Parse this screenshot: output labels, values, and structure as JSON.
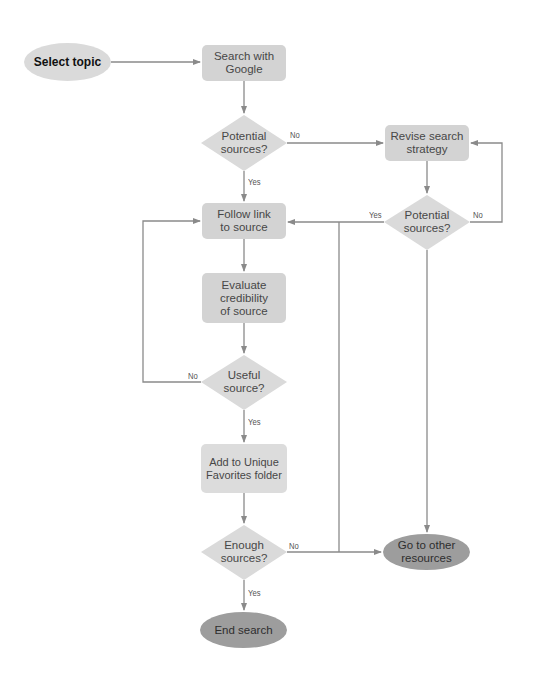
{
  "colors": {
    "box_fill": "#d3d3d3",
    "box_fill_light": "#dcdcdc",
    "diamond_fill": "#dadada",
    "terminal_dark": "#9d9d9d",
    "start_fill": "#dadada",
    "line": "#8a8a8a"
  },
  "nodes": {
    "select_topic": {
      "label": "Select topic",
      "shape": "ellipse"
    },
    "search_google": {
      "label": "Search with Google",
      "shape": "box"
    },
    "potential_sources_1": {
      "label": "Potential sources?",
      "shape": "diamond"
    },
    "revise_strategy": {
      "label": "Revise search strategy",
      "shape": "box"
    },
    "potential_sources_2": {
      "label": "Potential sources?",
      "shape": "diamond"
    },
    "follow_link": {
      "label": "Follow link to source",
      "shape": "box"
    },
    "evaluate": {
      "label": "Evaluate credibility of source",
      "shape": "box"
    },
    "useful_source": {
      "label": "Useful source?",
      "shape": "diamond"
    },
    "add_favorites": {
      "label": "Add to Unique Favorites folder",
      "shape": "box"
    },
    "enough_sources": {
      "label": "Enough sources?",
      "shape": "diamond"
    },
    "end_search": {
      "label": "End search",
      "shape": "ellipse"
    },
    "other_resources": {
      "label": "Go to other resources",
      "shape": "ellipse"
    }
  },
  "edge_labels": {
    "ps1_no": "No",
    "ps1_yes": "Yes",
    "ps2_yes": "Yes",
    "ps2_no": "No",
    "useful_no": "No",
    "useful_yes": "Yes",
    "enough_no": "No",
    "enough_yes": "Yes"
  },
  "edges": [
    {
      "from": "select_topic",
      "to": "search_google"
    },
    {
      "from": "search_google",
      "to": "potential_sources_1"
    },
    {
      "from": "potential_sources_1",
      "to": "revise_strategy",
      "label": "No"
    },
    {
      "from": "potential_sources_1",
      "to": "follow_link",
      "label": "Yes"
    },
    {
      "from": "revise_strategy",
      "to": "potential_sources_2"
    },
    {
      "from": "potential_sources_2",
      "to": "follow_link",
      "label": "Yes"
    },
    {
      "from": "potential_sources_2",
      "to": "revise_strategy",
      "label": "No"
    },
    {
      "from": "potential_sources_2",
      "to": "other_resources"
    },
    {
      "from": "follow_link",
      "to": "evaluate"
    },
    {
      "from": "evaluate",
      "to": "useful_source"
    },
    {
      "from": "useful_source",
      "to": "follow_link",
      "label": "No"
    },
    {
      "from": "useful_source",
      "to": "add_favorites",
      "label": "Yes"
    },
    {
      "from": "add_favorites",
      "to": "enough_sources"
    },
    {
      "from": "enough_sources",
      "to": "other_resources",
      "label": "No"
    },
    {
      "from": "enough_sources",
      "to": "end_search",
      "label": "Yes"
    }
  ]
}
